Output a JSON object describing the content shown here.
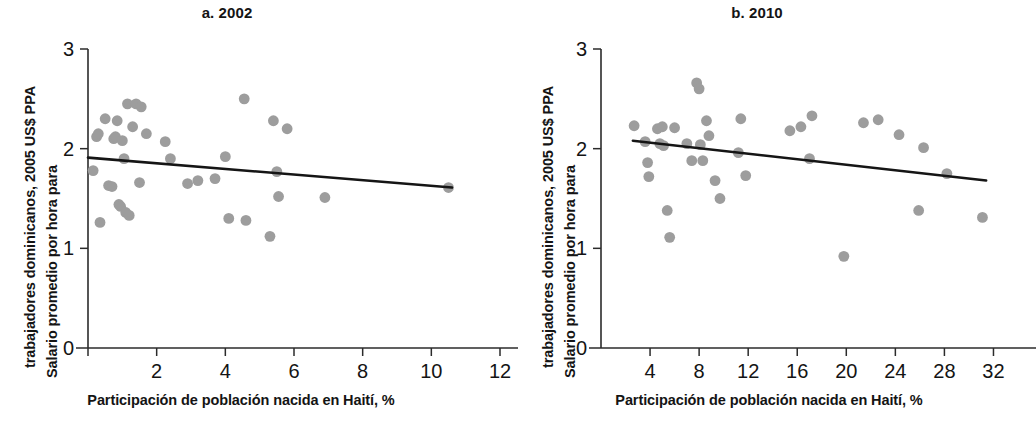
{
  "figure": {
    "background": "#ffffff",
    "point_color": "#9d9d9d",
    "line_color": "#151515",
    "axis_color": "#2b2b2b"
  },
  "panels": [
    {
      "id": "panel-a",
      "title": "a. 2002",
      "ylabel_line1": "Salario promedio por hora para",
      "ylabel_line2": "trabajadores dominicanos, 2005 US$ PPA",
      "xlabel": "Participación de población nacida en Haití, %"
    },
    {
      "id": "panel-b",
      "title": "b. 2010",
      "ylabel_line1": "Salario promedio por hora para",
      "ylabel_line2": "trabajadores dominicanos, 2005 US$ PPA",
      "xlabel": "Participación de población nacida en Haití, %"
    }
  ],
  "chart_data": [
    {
      "type": "scatter",
      "title": "a. 2002",
      "xlabel": "Participación de población nacida en Haití, %",
      "ylabel": "Salario promedio por hora para trabajadores dominicanos, 2005 US$ PPA",
      "xlim": [
        0,
        12
      ],
      "ylim": [
        0,
        3
      ],
      "xticks": [
        0,
        2,
        4,
        6,
        8,
        10,
        12
      ],
      "xtick_labels": [
        "",
        "2",
        "4",
        "6",
        "8",
        "10",
        "12"
      ],
      "yticks": [
        0,
        1,
        2,
        3
      ],
      "ytick_labels": [
        "0",
        "1",
        "2",
        "3"
      ],
      "grid": false,
      "legend": false,
      "points": [
        {
          "x": 0.15,
          "y": 1.78
        },
        {
          "x": 0.25,
          "y": 2.12
        },
        {
          "x": 0.3,
          "y": 2.15
        },
        {
          "x": 0.35,
          "y": 1.26
        },
        {
          "x": 0.5,
          "y": 2.3
        },
        {
          "x": 0.6,
          "y": 1.63
        },
        {
          "x": 0.7,
          "y": 1.62
        },
        {
          "x": 0.75,
          "y": 2.1
        },
        {
          "x": 0.8,
          "y": 2.12
        },
        {
          "x": 0.85,
          "y": 2.28
        },
        {
          "x": 0.9,
          "y": 1.44
        },
        {
          "x": 0.95,
          "y": 1.42
        },
        {
          "x": 1.0,
          "y": 2.08
        },
        {
          "x": 1.05,
          "y": 1.9
        },
        {
          "x": 1.1,
          "y": 1.36
        },
        {
          "x": 1.15,
          "y": 2.45
        },
        {
          "x": 1.2,
          "y": 1.33
        },
        {
          "x": 1.3,
          "y": 2.22
        },
        {
          "x": 1.4,
          "y": 2.45
        },
        {
          "x": 1.5,
          "y": 1.66
        },
        {
          "x": 1.55,
          "y": 2.42
        },
        {
          "x": 1.7,
          "y": 2.15
        },
        {
          "x": 2.25,
          "y": 2.07
        },
        {
          "x": 2.4,
          "y": 1.9
        },
        {
          "x": 2.9,
          "y": 1.65
        },
        {
          "x": 3.2,
          "y": 1.68
        },
        {
          "x": 3.7,
          "y": 1.7
        },
        {
          "x": 4.0,
          "y": 1.92
        },
        {
          "x": 4.1,
          "y": 1.3
        },
        {
          "x": 4.55,
          "y": 2.5
        },
        {
          "x": 4.6,
          "y": 1.28
        },
        {
          "x": 5.3,
          "y": 1.12
        },
        {
          "x": 5.4,
          "y": 2.28
        },
        {
          "x": 5.5,
          "y": 1.77
        },
        {
          "x": 5.55,
          "y": 1.52
        },
        {
          "x": 5.8,
          "y": 2.2
        },
        {
          "x": 6.9,
          "y": 1.51
        },
        {
          "x": 10.5,
          "y": 1.61
        }
      ],
      "fit_line": {
        "x0": 0.0,
        "y0": 1.91,
        "x1": 10.6,
        "y1": 1.61,
        "slope": -0.0283
      }
    },
    {
      "type": "scatter",
      "title": "b. 2010",
      "xlabel": "Participación de población nacida en Haití, %",
      "ylabel": "Salario promedio por hora para trabajadores dominicanos, 2005 US$ PPA",
      "xlim": [
        0,
        34
      ],
      "ylim": [
        0,
        3
      ],
      "xticks": [
        4,
        8,
        12,
        16,
        20,
        24,
        28,
        32
      ],
      "xtick_labels": [
        "4",
        "8",
        "12",
        "16",
        "20",
        "24",
        "28",
        "32"
      ],
      "yticks": [
        0,
        1,
        2,
        3
      ],
      "ytick_labels": [
        "0",
        "1",
        "2",
        "3"
      ],
      "grid": false,
      "legend": false,
      "points": [
        {
          "x": 2.7,
          "y": 2.23
        },
        {
          "x": 3.6,
          "y": 2.07
        },
        {
          "x": 3.8,
          "y": 1.86
        },
        {
          "x": 3.9,
          "y": 1.72
        },
        {
          "x": 4.6,
          "y": 2.2
        },
        {
          "x": 4.8,
          "y": 2.05
        },
        {
          "x": 5.0,
          "y": 2.22
        },
        {
          "x": 5.1,
          "y": 2.03
        },
        {
          "x": 5.4,
          "y": 1.38
        },
        {
          "x": 5.6,
          "y": 1.11
        },
        {
          "x": 6.0,
          "y": 2.21
        },
        {
          "x": 7.0,
          "y": 2.05
        },
        {
          "x": 7.4,
          "y": 1.88
        },
        {
          "x": 7.8,
          "y": 2.66
        },
        {
          "x": 8.0,
          "y": 2.6
        },
        {
          "x": 8.1,
          "y": 2.04
        },
        {
          "x": 8.3,
          "y": 1.88
        },
        {
          "x": 8.6,
          "y": 2.28
        },
        {
          "x": 8.8,
          "y": 2.13
        },
        {
          "x": 9.3,
          "y": 1.68
        },
        {
          "x": 9.7,
          "y": 1.5
        },
        {
          "x": 11.2,
          "y": 1.96
        },
        {
          "x": 11.4,
          "y": 2.3
        },
        {
          "x": 11.8,
          "y": 1.73
        },
        {
          "x": 15.4,
          "y": 2.18
        },
        {
          "x": 16.3,
          "y": 2.22
        },
        {
          "x": 17.0,
          "y": 1.9
        },
        {
          "x": 17.2,
          "y": 2.33
        },
        {
          "x": 19.8,
          "y": 0.92
        },
        {
          "x": 21.4,
          "y": 2.26
        },
        {
          "x": 22.6,
          "y": 2.29
        },
        {
          "x": 24.3,
          "y": 2.14
        },
        {
          "x": 25.9,
          "y": 1.38
        },
        {
          "x": 26.3,
          "y": 2.01
        },
        {
          "x": 28.2,
          "y": 1.75
        },
        {
          "x": 31.1,
          "y": 1.31
        }
      ],
      "fit_line": {
        "x0": 2.6,
        "y0": 2.08,
        "x1": 31.4,
        "y1": 1.68,
        "slope": -0.0139
      }
    }
  ]
}
